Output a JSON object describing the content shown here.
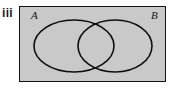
{
  "figure": {
    "name": "venn-diagram-two-sets-overlapping",
    "part_label": "iii",
    "colors": {
      "page_background": "#ffffff",
      "universal_set_fill": "#c9c9c9",
      "universal_set_border": "#111111",
      "circle_stroke": "#0d0d0d",
      "label_text": "#141414",
      "part_label_text": "#1a1a1a"
    },
    "universal_set": {
      "shape": "rectangle",
      "fill": "#c9c9c9",
      "border_width_px": 1,
      "x": 19,
      "y": 6,
      "width": 147,
      "height": 76
    },
    "sets": [
      {
        "label": "A",
        "shape": "circle",
        "center_x": 74,
        "center_y": 46,
        "radius_x": 40,
        "radius_y": 26,
        "label_position": "top-left-inside-rectangle"
      },
      {
        "label": "B",
        "shape": "circle",
        "center_x": 115,
        "center_y": 46,
        "radius_x": 37,
        "radius_y": 26,
        "label_position": "top-right-inside-rectangle"
      }
    ],
    "intersection": {
      "present": true,
      "shaded": false,
      "label": ""
    }
  }
}
